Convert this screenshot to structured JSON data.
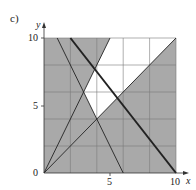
{
  "figure": {
    "part_label": "c)",
    "x_axis": {
      "name": "x",
      "ticks": [
        "0",
        "5",
        "10"
      ]
    },
    "y_axis": {
      "name": "y",
      "ticks": [
        "0",
        "5",
        "10"
      ]
    },
    "colors": {
      "shade": "#a9a9a9",
      "grid": "#7a7a7a",
      "line": "#222222",
      "feasible": "#ffffff"
    },
    "domain": {
      "xmin": 0,
      "xmax": 10,
      "ymin": 0,
      "ymax": 10,
      "grid_step": 2
    },
    "lines": [
      {
        "name": "y = x",
        "from": [
          0,
          0
        ],
        "to": [
          10,
          10
        ],
        "weight": "thin"
      },
      {
        "name": "y = 2x",
        "from": [
          0,
          0
        ],
        "to": [
          5,
          10
        ],
        "weight": "thin"
      },
      {
        "name": "y = -2x + 12",
        "from": [
          1,
          10
        ],
        "to": [
          6,
          0
        ],
        "weight": "thin"
      },
      {
        "name": "5x + 4y = 50",
        "from": [
          2,
          10
        ],
        "to": [
          10,
          0
        ],
        "weight": "thick"
      }
    ],
    "unshaded_region": [
      [
        3,
        6
      ],
      [
        4,
        4
      ],
      [
        10,
        10
      ],
      [
        5,
        10
      ]
    ]
  }
}
